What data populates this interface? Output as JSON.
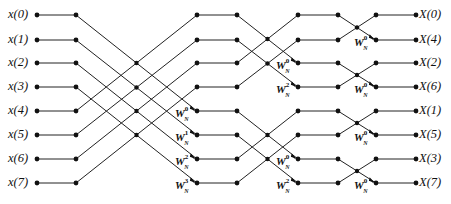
{
  "diagram": {
    "type": "8-point radix-2 DIF FFT butterfly signal-flow graph",
    "row_y": [
      15,
      40,
      63,
      87,
      111,
      135,
      159,
      183
    ],
    "columns_x": [
      37,
      76,
      197,
      237,
      298,
      338,
      376,
      416
    ],
    "line_color": "#222222",
    "dot_color": "#111111"
  },
  "inputs": [
    {
      "label": "x(0)"
    },
    {
      "label": "x(1)"
    },
    {
      "label": "x(2)"
    },
    {
      "label": "x(3)"
    },
    {
      "label": "x(4)"
    },
    {
      "label": "x(5)"
    },
    {
      "label": "x(6)"
    },
    {
      "label": "x(7)"
    }
  ],
  "outputs": [
    {
      "label": "X(0)"
    },
    {
      "label": "X(4)"
    },
    {
      "label": "X(2)"
    },
    {
      "label": "X(6)"
    },
    {
      "label": "X(1)"
    },
    {
      "label": "X(5)"
    },
    {
      "label": "X(3)"
    },
    {
      "label": "X(7)"
    }
  ],
  "twiddles": {
    "stage1": [
      {
        "base": "W",
        "sub": "N",
        "exp": "0"
      },
      {
        "base": "W",
        "sub": "N",
        "exp": "1"
      },
      {
        "base": "W",
        "sub": "N",
        "exp": "2"
      },
      {
        "base": "W",
        "sub": "N",
        "exp": "3"
      }
    ],
    "stage2": [
      {
        "base": "W",
        "sub": "N",
        "exp": "0"
      },
      {
        "base": "W",
        "sub": "N",
        "exp": "2"
      },
      {
        "base": "W",
        "sub": "N",
        "exp": "0"
      },
      {
        "base": "W",
        "sub": "N",
        "exp": "2"
      }
    ],
    "stage3": [
      {
        "base": "W",
        "sub": "N",
        "exp": "0"
      },
      {
        "base": "W",
        "sub": "N",
        "exp": "0"
      },
      {
        "base": "W",
        "sub": "N",
        "exp": "0"
      },
      {
        "base": "W",
        "sub": "N",
        "exp": "0"
      }
    ]
  }
}
